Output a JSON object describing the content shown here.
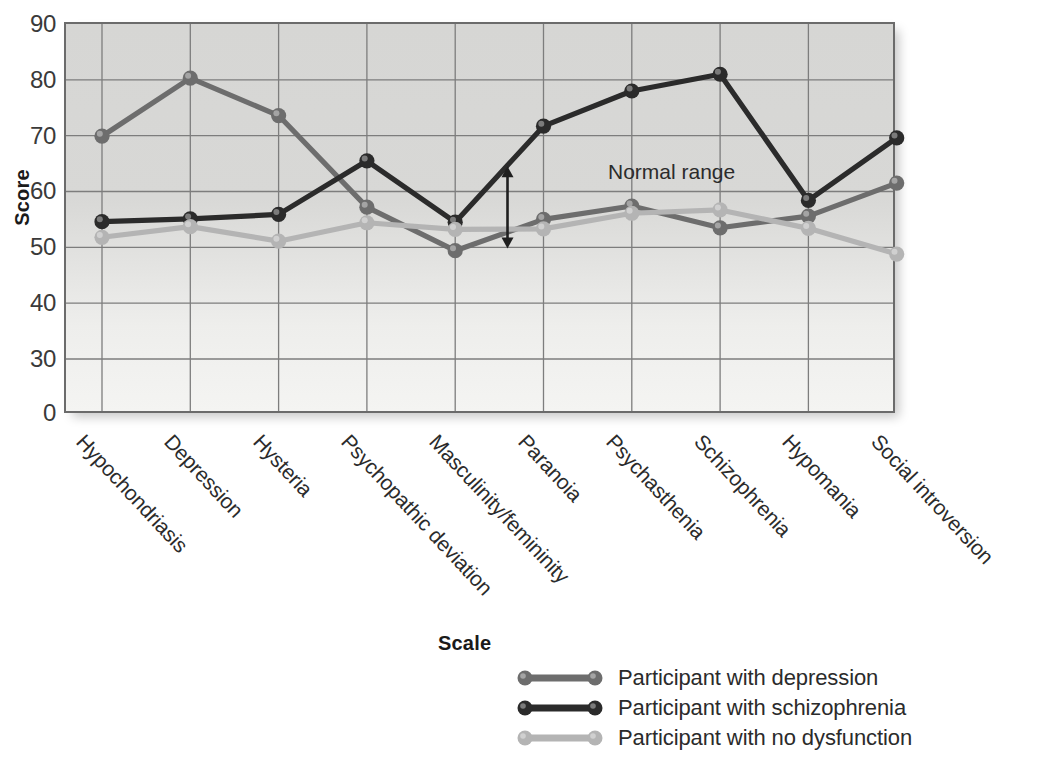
{
  "chart_data": {
    "type": "line",
    "title": "",
    "xlabel": "",
    "ylabel": "Score",
    "ylim": [
      0,
      90
    ],
    "yticks": [
      0,
      30,
      40,
      50,
      60,
      70,
      80,
      90
    ],
    "broken_axis_note": "axis breaks between 0 and 30",
    "grid": true,
    "legend_position": "bottom",
    "legend_title": "Scale",
    "categories": [
      "Hypochondriasis",
      "Depression",
      "Hysteria",
      "Psychopathic deviation",
      "Masculinity/femininity",
      "Paranoia",
      "Psychasthenia",
      "Schizophrenia",
      "Hypomania",
      "Social introversion"
    ],
    "series": [
      {
        "name": "Participant with depression",
        "color": "#6d6d6d",
        "values": [
          69.9,
          80.3,
          73.6,
          57.2,
          49.4,
          55.0,
          57.4,
          53.5,
          55.6,
          61.5
        ]
      },
      {
        "name": "Participant with schizophrenia",
        "color": "#2b2b2b",
        "values": [
          54.6,
          55.1,
          55.9,
          65.5,
          54.5,
          71.7,
          78.0,
          81.0,
          58.4,
          69.6
        ]
      },
      {
        "name": "Participant with no dysfunction",
        "color": "#b4b4b4",
        "values": [
          51.8,
          53.7,
          51.1,
          54.4,
          53.2,
          53.3,
          56.1,
          56.7,
          53.4,
          48.8
        ]
      }
    ],
    "annotations": [
      {
        "name": "normal-range",
        "label": "Normal range",
        "arrow_top_value": 64.5,
        "arrow_bottom_value": 49.8,
        "at_category_index": 5
      }
    ]
  }
}
